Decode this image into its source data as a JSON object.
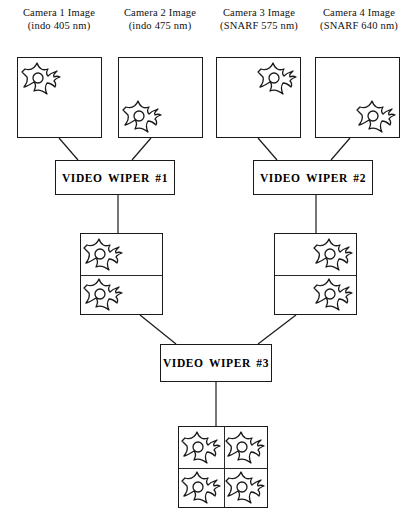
{
  "diagram": {
    "line_color": "#1a1a1a",
    "background": "#ffffff"
  },
  "camera_labels": [
    {
      "line1": "Camera 1 Image",
      "line2": "(indo 405 nm)"
    },
    {
      "line1": "Camera 2 Image",
      "line2": "(indo 475 nm)"
    },
    {
      "line1": "Camera 3 Image",
      "line2": "(SNARF 575 nm)"
    },
    {
      "line1": "Camera 4 Image",
      "line2": "(SNARF 640 nm)"
    }
  ],
  "camera_images": [
    {
      "name": "camera-1-image-box",
      "cell_position": "top-left"
    },
    {
      "name": "camera-2-image-box",
      "cell_position": "bottom-left"
    },
    {
      "name": "camera-3-image-box",
      "cell_position": "top-right"
    },
    {
      "name": "camera-4-image-box",
      "cell_position": "bottom-right"
    }
  ],
  "wipers": [
    {
      "label": "VIDEO  WIPER  #1"
    },
    {
      "label": "VIDEO  WIPER  #2"
    },
    {
      "label": "VIDEO  WIPER  #3"
    }
  ],
  "intermediate_images": [
    {
      "name": "wiper-1-output-box",
      "rows": 2,
      "cell_side": "left"
    },
    {
      "name": "wiper-2-output-box",
      "rows": 2,
      "cell_side": "right"
    }
  ],
  "final_image": {
    "name": "wiper-3-output-box",
    "rows": 2,
    "columns": 2,
    "cell_count": 4
  },
  "icons": {
    "cell": "cell-icon"
  }
}
